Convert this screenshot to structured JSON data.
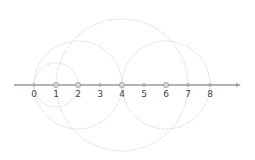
{
  "diagram": {
    "type": "number-line-with-circles",
    "axis": {
      "color": "#9a9a9a",
      "arrow": "right",
      "ticks": [
        "0",
        "1",
        "2",
        "3",
        "4",
        "5",
        "6",
        "7",
        "8"
      ]
    },
    "highlighted_points": [
      "1",
      "2",
      "4",
      "6"
    ],
    "circles": [
      {
        "center": 1,
        "radius": 1
      },
      {
        "center": 2,
        "radius": 2
      },
      {
        "center": 4,
        "radius": 3
      },
      {
        "center": 6,
        "radius": 2
      }
    ],
    "circle_style": {
      "stroke": "#c8c8c8",
      "dash": "dotted"
    }
  }
}
